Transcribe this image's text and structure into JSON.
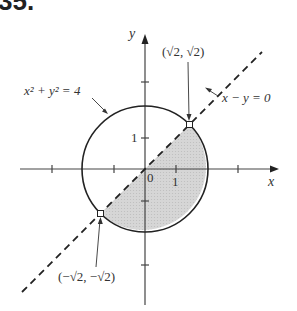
{
  "problem_number": "35.",
  "axes": {
    "x_label": "x",
    "y_label": "y",
    "origin_label": "0",
    "x_tick_label": "1",
    "y_tick_label": "1"
  },
  "curves": {
    "circle": {
      "equation": "x² + y² = 4",
      "radius": 2
    },
    "line": {
      "equation": "x − y = 0",
      "style": "dashed"
    }
  },
  "points": [
    {
      "label": "(√2, √2)"
    },
    {
      "label": "(−√2, −√2)"
    }
  ],
  "shaded_region": "half-disk below y = x",
  "colors": {
    "shade": "#d4d4d4",
    "stroke": "#222222"
  }
}
